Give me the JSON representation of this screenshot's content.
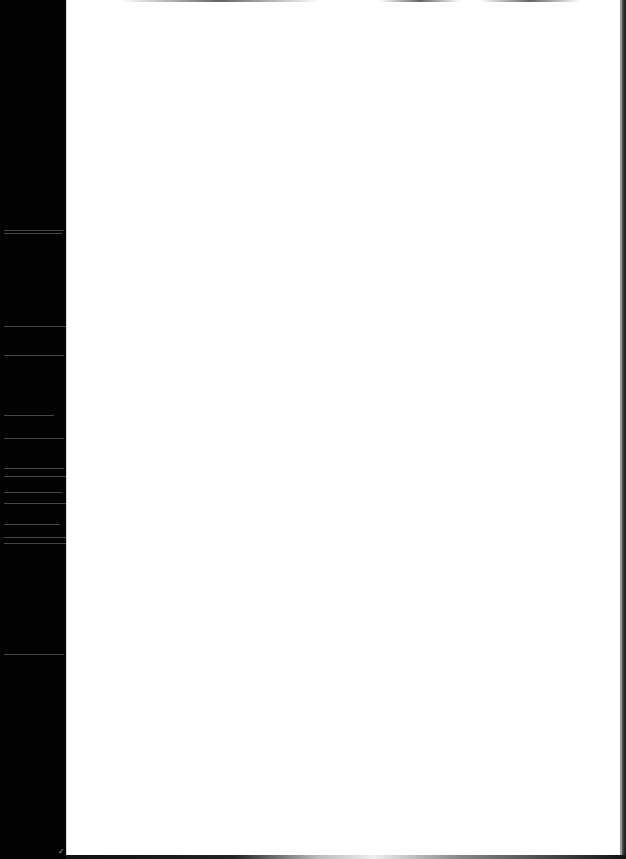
{
  "document": {
    "type": "scanned-page",
    "content": "",
    "is_blank": true
  },
  "colors": {
    "page": "#ffffff",
    "scanner_bed": "#000000"
  }
}
